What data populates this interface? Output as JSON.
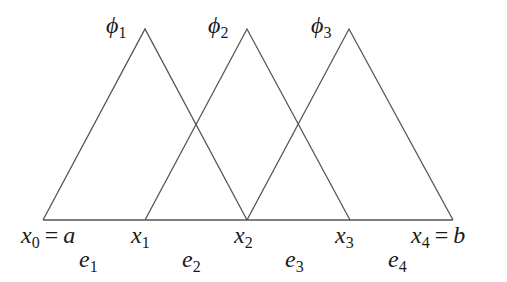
{
  "diagram": {
    "line_color": "#555555",
    "baseline": {
      "from": "x0",
      "to": "x4"
    },
    "nodes": [
      {
        "id": "x0",
        "sym": "x",
        "sub": "0",
        "eq": "=",
        "rhs": "a",
        "px": 43
      },
      {
        "id": "x1",
        "sym": "x",
        "sub": "1",
        "px": 145
      },
      {
        "id": "x2",
        "sym": "x",
        "sub": "2",
        "px": 247
      },
      {
        "id": "x3",
        "sym": "x",
        "sub": "3",
        "px": 350
      },
      {
        "id": "x4",
        "sym": "x",
        "sub": "4",
        "eq": "=",
        "rhs": "b",
        "px": 453
      }
    ],
    "elements": [
      {
        "id": "e1",
        "sym": "e",
        "sub": "1"
      },
      {
        "id": "e2",
        "sym": "e",
        "sub": "2"
      },
      {
        "id": "e3",
        "sym": "e",
        "sub": "3"
      },
      {
        "id": "e4",
        "sym": "e",
        "sub": "4"
      }
    ],
    "basis_functions": [
      {
        "id": "phi1",
        "sym": "ϕ",
        "sub": "1",
        "support": [
          "x0",
          "x2"
        ],
        "peak": "x1"
      },
      {
        "id": "phi2",
        "sym": "ϕ",
        "sub": "2",
        "support": [
          "x1",
          "x3"
        ],
        "peak": "x2"
      },
      {
        "id": "phi3",
        "sym": "ϕ",
        "sub": "3",
        "support": [
          "x2",
          "x4"
        ],
        "peak": "x3"
      }
    ]
  }
}
